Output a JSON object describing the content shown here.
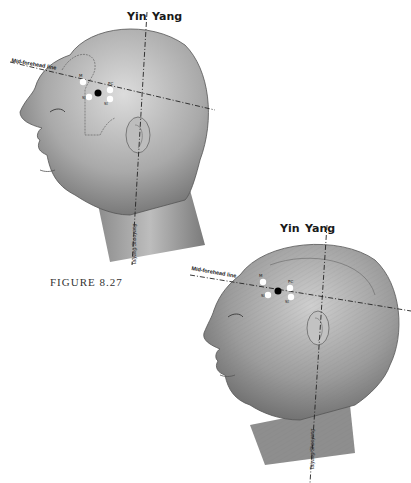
{
  "figure": {
    "caption": "FIGURE 8.27",
    "top_diagram": {
      "yin_label": "Yin",
      "yang_label": "Yang",
      "mid_forehead_label": "Mid-forehead line",
      "vertical_line_label": "Taiyang/Shaoyang",
      "points": [
        {
          "label": "M",
          "color": "white"
        },
        {
          "label": "PC",
          "color": "white"
        },
        {
          "label": "Si",
          "color": "white"
        },
        {
          "label": "St",
          "color": "white"
        },
        {
          "label": "",
          "color": "black"
        }
      ]
    },
    "bottom_diagram": {
      "yin_label": "Yin",
      "yang_label": "Yang",
      "mid_forehead_label": "Mid-forehead line",
      "vertical_line_label": "Taiyang/Shaoyang",
      "points": [
        {
          "label": "M",
          "color": "white"
        },
        {
          "label": "PC",
          "color": "white"
        },
        {
          "label": "Si",
          "color": "white"
        },
        {
          "label": "St",
          "color": "white"
        },
        {
          "label": "",
          "color": "black"
        }
      ]
    }
  },
  "colors": {
    "skin_light": "#d9d9d9",
    "skin_mid": "#a8a8a8",
    "skin_dark": "#6e6e6e",
    "line": "#222222",
    "background": "#ffffff"
  }
}
